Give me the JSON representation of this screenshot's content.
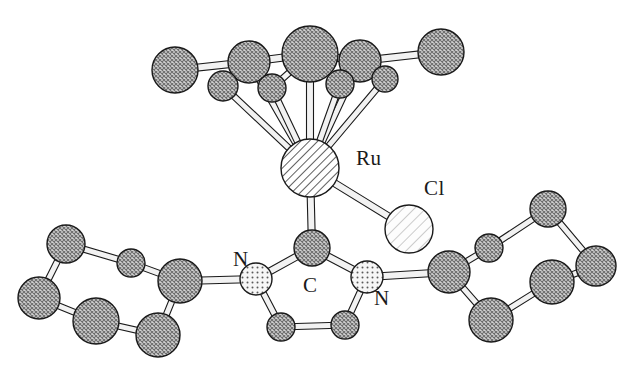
{
  "figure": {
    "type": "crystal-structure-ortep",
    "background_color": "#ffffff",
    "outline_color": "#1a1a1a",
    "bond_fill_color": "#f2f2f2",
    "width": 629,
    "height": 368
  },
  "labels": [
    {
      "id": "label-ru",
      "text": "Ru",
      "x": 356,
      "y": 148,
      "element": "Ru"
    },
    {
      "id": "label-cl",
      "text": "Cl",
      "x": 424,
      "y": 178,
      "element": "Cl"
    },
    {
      "id": "label-n-left",
      "text": "N",
      "x": 233,
      "y": 249,
      "element": "N"
    },
    {
      "id": "label-c-carbene",
      "text": "C",
      "x": 303,
      "y": 275,
      "element": "C"
    },
    {
      "id": "label-n-right",
      "text": "N",
      "x": 374,
      "y": 288,
      "element": "N"
    }
  ],
  "element_styles": {
    "Ru": {
      "fill": "#ffffff",
      "pattern": "diagonal-hatch-dense",
      "stroke": "#1a1a1a"
    },
    "Cl": {
      "fill": "#fbfbfb",
      "pattern": "diagonal-hatch-sparse",
      "stroke": "#1a1a1a"
    },
    "N": {
      "fill": "#f7f7f7",
      "pattern": "stipple-dots",
      "stroke": "#1a1a1a"
    },
    "C": {
      "fill": "#c8c8c8",
      "pattern": "cross-hatch",
      "stroke": "#1a1a1a"
    }
  },
  "atoms": [
    {
      "id": "ru1",
      "element": "Ru",
      "x": 310,
      "y": 168,
      "r": 29
    },
    {
      "id": "cl1",
      "element": "Cl",
      "x": 409,
      "y": 229,
      "r": 24
    },
    {
      "id": "ar1",
      "element": "C",
      "x": 310,
      "y": 54,
      "r": 28
    },
    {
      "id": "ar2",
      "element": "C",
      "x": 249,
      "y": 62,
      "r": 21
    },
    {
      "id": "ar3",
      "element": "C",
      "x": 360,
      "y": 61,
      "r": 21
    },
    {
      "id": "ar4",
      "element": "C",
      "x": 223,
      "y": 86,
      "r": 15
    },
    {
      "id": "ar5",
      "element": "C",
      "x": 272,
      "y": 88,
      "r": 14
    },
    {
      "id": "ar6",
      "element": "C",
      "x": 340,
      "y": 84,
      "r": 14
    },
    {
      "id": "ar7",
      "element": "C",
      "x": 385,
      "y": 79,
      "r": 13
    },
    {
      "id": "me1",
      "element": "C",
      "x": 175,
      "y": 70,
      "r": 23
    },
    {
      "id": "me2",
      "element": "C",
      "x": 441,
      "y": 52,
      "r": 23
    },
    {
      "id": "c1",
      "element": "C",
      "x": 312,
      "y": 248,
      "r": 18
    },
    {
      "id": "n1",
      "element": "N",
      "x": 256,
      "y": 279,
      "r": 16
    },
    {
      "id": "n2",
      "element": "N",
      "x": 367,
      "y": 277,
      "r": 16
    },
    {
      "id": "c4",
      "element": "C",
      "x": 281,
      "y": 327,
      "r": 14
    },
    {
      "id": "c5",
      "element": "C",
      "x": 345,
      "y": 325,
      "r": 14
    },
    {
      "id": "lp1",
      "element": "C",
      "x": 180,
      "y": 281,
      "r": 22
    },
    {
      "id": "lp2",
      "element": "C",
      "x": 131,
      "y": 263,
      "r": 14
    },
    {
      "id": "lp3",
      "element": "C",
      "x": 66,
      "y": 244,
      "r": 19
    },
    {
      "id": "lp4",
      "element": "C",
      "x": 39,
      "y": 298,
      "r": 21
    },
    {
      "id": "lp5",
      "element": "C",
      "x": 96,
      "y": 321,
      "r": 23
    },
    {
      "id": "lp6",
      "element": "C",
      "x": 158,
      "y": 335,
      "r": 22
    },
    {
      "id": "rp1",
      "element": "C",
      "x": 449,
      "y": 272,
      "r": 21
    },
    {
      "id": "rp2",
      "element": "C",
      "x": 489,
      "y": 248,
      "r": 14
    },
    {
      "id": "rp3",
      "element": "C",
      "x": 548,
      "y": 209,
      "r": 18
    },
    {
      "id": "rp4",
      "element": "C",
      "x": 596,
      "y": 266,
      "r": 20
    },
    {
      "id": "rp5",
      "element": "C",
      "x": 552,
      "y": 282,
      "r": 22
    },
    {
      "id": "rp6",
      "element": "C",
      "x": 491,
      "y": 320,
      "r": 22
    }
  ],
  "bonds": [
    {
      "from": "ru1",
      "to": "ar1",
      "w": 7
    },
    {
      "from": "ru1",
      "to": "ar2",
      "w": 6
    },
    {
      "from": "ru1",
      "to": "ar3",
      "w": 6
    },
    {
      "from": "ru1",
      "to": "ar4",
      "w": 6
    },
    {
      "from": "ru1",
      "to": "ar5",
      "w": 6
    },
    {
      "from": "ru1",
      "to": "ar6",
      "w": 6
    },
    {
      "from": "ru1",
      "to": "ar7",
      "w": 6
    },
    {
      "from": "ru1",
      "to": "cl1",
      "w": 7
    },
    {
      "from": "ru1",
      "to": "c1",
      "w": 7
    },
    {
      "from": "ar2",
      "to": "me1",
      "w": 7
    },
    {
      "from": "ar2",
      "to": "ar1",
      "w": 7
    },
    {
      "from": "ar1",
      "to": "ar3",
      "w": 7
    },
    {
      "from": "ar3",
      "to": "me2",
      "w": 7
    },
    {
      "from": "ar2",
      "to": "ar4",
      "w": 6
    },
    {
      "from": "ar1",
      "to": "ar5",
      "w": 6
    },
    {
      "from": "ar3",
      "to": "ar6",
      "w": 6
    },
    {
      "from": "ar3",
      "to": "ar7",
      "w": 6
    },
    {
      "from": "c1",
      "to": "n1",
      "w": 7
    },
    {
      "from": "c1",
      "to": "n2",
      "w": 7
    },
    {
      "from": "n1",
      "to": "c4",
      "w": 6
    },
    {
      "from": "n2",
      "to": "c5",
      "w": 6
    },
    {
      "from": "c4",
      "to": "c5",
      "w": 6
    },
    {
      "from": "n1",
      "to": "lp1",
      "w": 7
    },
    {
      "from": "lp1",
      "to": "lp2",
      "w": 6
    },
    {
      "from": "lp2",
      "to": "lp3",
      "w": 6
    },
    {
      "from": "lp3",
      "to": "lp4",
      "w": 6
    },
    {
      "from": "lp4",
      "to": "lp5",
      "w": 6
    },
    {
      "from": "lp5",
      "to": "lp6",
      "w": 6
    },
    {
      "from": "lp6",
      "to": "lp1",
      "w": 6
    },
    {
      "from": "n2",
      "to": "rp1",
      "w": 7
    },
    {
      "from": "rp1",
      "to": "rp2",
      "w": 6
    },
    {
      "from": "rp2",
      "to": "rp3",
      "w": 6
    },
    {
      "from": "rp3",
      "to": "rp4",
      "w": 6
    },
    {
      "from": "rp4",
      "to": "rp5",
      "w": 6
    },
    {
      "from": "rp5",
      "to": "rp6",
      "w": 6
    },
    {
      "from": "rp6",
      "to": "rp1",
      "w": 6
    }
  ]
}
